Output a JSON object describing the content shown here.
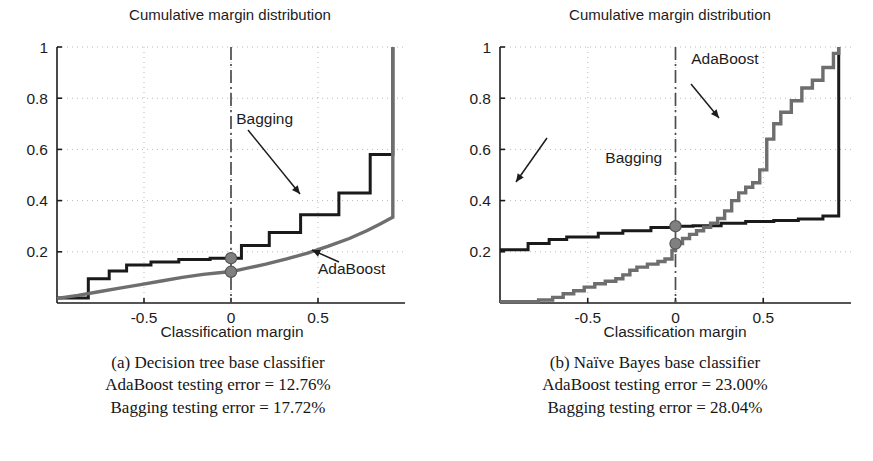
{
  "figure": {
    "background_color": "#ffffff",
    "panels": [
      {
        "id": "a",
        "title": "Cumulative margin distribution",
        "xlabel": "Classification margin",
        "ylabel": "",
        "caption_lines": [
          "(a) Decision tree base classifier",
          "AdaBoost testing error = 12.76%",
          "Bagging testing error = 17.72%"
        ],
        "annotations": [
          {
            "label": "Bagging",
            "x": 0.03,
            "y": 0.7
          },
          {
            "label": "AdaBoost",
            "x": 0.5,
            "y": 0.115
          }
        ]
      },
      {
        "id": "b",
        "title": "Cumulative margin distribution",
        "xlabel": "Classification margin",
        "ylabel": "",
        "caption_lines": [
          "(b) Naïve Bayes base classifier",
          "AdaBoost testing error = 23.00%",
          "Bagging testing error = 28.04%"
        ],
        "annotations": [
          {
            "label": "AdaBoost",
            "x": 0.09,
            "y": 0.935
          },
          {
            "label": "Bagging",
            "x": -0.4,
            "y": 0.545
          }
        ]
      }
    ]
  },
  "chart_data": [
    {
      "type": "line",
      "panel": "a",
      "title": "Cumulative margin distribution",
      "xlabel": "Classification margin",
      "ylabel": "",
      "xlim": [
        -1.0,
        1.0
      ],
      "ylim": [
        0.0,
        1.0
      ],
      "xticks": [
        -0.5,
        0,
        0.5
      ],
      "xtick_labels": [
        "-0.5",
        "0",
        "0.5"
      ],
      "yticks": [
        0.2,
        0.4,
        0.6,
        0.8,
        1
      ],
      "ytick_labels": [
        "0.2",
        "0.4",
        "0.6",
        "0.8",
        "1"
      ],
      "grid": "dotted",
      "legend_position": "inline-annotations",
      "reference_line": {
        "x": 0,
        "style": "dash-dot",
        "color": "#4d4d4d"
      },
      "series": [
        {
          "name": "Bagging",
          "style": "step",
          "color": "#1a1a1a",
          "width": 3.0,
          "x": [
            -1.0,
            -0.82,
            -0.82,
            -0.7,
            -0.7,
            -0.6,
            -0.6,
            -0.46,
            -0.46,
            -0.3,
            -0.3,
            -0.12,
            -0.12,
            0.0,
            0.0,
            0.06,
            0.06,
            0.22,
            0.22,
            0.4,
            0.4,
            0.62,
            0.62,
            0.8,
            0.8,
            0.93,
            0.93
          ],
          "y": [
            0.02,
            0.02,
            0.095,
            0.095,
            0.125,
            0.125,
            0.148,
            0.148,
            0.16,
            0.16,
            0.17,
            0.17,
            0.175,
            0.175,
            0.175,
            0.175,
            0.225,
            0.225,
            0.275,
            0.275,
            0.345,
            0.345,
            0.43,
            0.43,
            0.58,
            0.58,
            1.0
          ]
        },
        {
          "name": "AdaBoost",
          "style": "smooth",
          "color": "#6e6e6e",
          "width": 3.4,
          "x": [
            -1.0,
            -0.88,
            -0.76,
            -0.64,
            -0.52,
            -0.4,
            -0.28,
            -0.16,
            -0.04,
            0.0,
            0.08,
            0.2,
            0.32,
            0.44,
            0.56,
            0.68,
            0.78,
            0.86,
            0.91,
            0.93,
            0.93
          ],
          "y": [
            0.018,
            0.03,
            0.044,
            0.058,
            0.072,
            0.086,
            0.1,
            0.112,
            0.12,
            0.122,
            0.134,
            0.152,
            0.172,
            0.195,
            0.222,
            0.252,
            0.282,
            0.31,
            0.328,
            0.335,
            1.0
          ]
        }
      ],
      "markers": [
        {
          "series": "Bagging",
          "x": 0,
          "y": 0.175,
          "color": "#808080",
          "shape": "circle"
        },
        {
          "series": "AdaBoost",
          "x": 0,
          "y": 0.122,
          "color": "#808080",
          "shape": "circle"
        }
      ]
    },
    {
      "type": "line",
      "panel": "b",
      "title": "Cumulative margin distribution",
      "xlabel": "Classification margin",
      "ylabel": "",
      "xlim": [
        -1.0,
        1.0
      ],
      "ylim": [
        0.0,
        1.0
      ],
      "xticks": [
        -0.5,
        0,
        0.5
      ],
      "xtick_labels": [
        "-0.5",
        "0",
        "0.5"
      ],
      "yticks": [
        0.2,
        0.4,
        0.6,
        0.8,
        1
      ],
      "ytick_labels": [
        "0.2",
        "0.4",
        "0.6",
        "0.8",
        "1"
      ],
      "grid": "dotted",
      "legend_position": "inline-annotations",
      "reference_line": {
        "x": 0,
        "style": "dash-dot",
        "color": "#4d4d4d"
      },
      "series": [
        {
          "name": "Bagging",
          "style": "step",
          "color": "#1a1a1a",
          "width": 3.0,
          "x": [
            -1.0,
            -0.84,
            -0.84,
            -0.72,
            -0.72,
            -0.62,
            -0.62,
            -0.44,
            -0.44,
            -0.3,
            -0.3,
            -0.14,
            -0.14,
            0.0,
            0.0,
            0.1,
            0.1,
            0.26,
            0.26,
            0.4,
            0.4,
            0.56,
            0.56,
            0.7,
            0.7,
            0.84,
            0.84,
            0.93,
            0.93
          ],
          "y": [
            0.208,
            0.208,
            0.232,
            0.232,
            0.248,
            0.248,
            0.258,
            0.258,
            0.272,
            0.272,
            0.282,
            0.282,
            0.295,
            0.295,
            0.3,
            0.3,
            0.302,
            0.302,
            0.312,
            0.312,
            0.318,
            0.318,
            0.322,
            0.322,
            0.328,
            0.328,
            0.34,
            0.34,
            1.0
          ]
        },
        {
          "name": "AdaBoost",
          "style": "step",
          "color": "#6e6e6e",
          "width": 3.4,
          "x": [
            -1.0,
            -0.78,
            -0.78,
            -0.7,
            -0.7,
            -0.64,
            -0.64,
            -0.58,
            -0.58,
            -0.52,
            -0.52,
            -0.46,
            -0.46,
            -0.4,
            -0.4,
            -0.34,
            -0.34,
            -0.3,
            -0.3,
            -0.26,
            -0.26,
            -0.22,
            -0.22,
            -0.16,
            -0.16,
            -0.1,
            -0.1,
            -0.06,
            -0.06,
            -0.02,
            -0.02,
            0.0,
            0.0,
            0.04,
            0.04,
            0.08,
            0.08,
            0.12,
            0.12,
            0.16,
            0.16,
            0.2,
            0.2,
            0.24,
            0.24,
            0.28,
            0.28,
            0.32,
            0.32,
            0.36,
            0.36,
            0.4,
            0.4,
            0.44,
            0.44,
            0.48,
            0.48,
            0.52,
            0.52,
            0.56,
            0.56,
            0.6,
            0.6,
            0.66,
            0.66,
            0.72,
            0.72,
            0.78,
            0.78,
            0.84,
            0.84,
            0.9,
            0.9,
            0.93,
            0.93
          ],
          "y": [
            0.005,
            0.005,
            0.012,
            0.012,
            0.022,
            0.022,
            0.036,
            0.036,
            0.048,
            0.048,
            0.062,
            0.062,
            0.075,
            0.075,
            0.085,
            0.085,
            0.095,
            0.095,
            0.11,
            0.11,
            0.128,
            0.128,
            0.14,
            0.14,
            0.152,
            0.152,
            0.162,
            0.162,
            0.172,
            0.172,
            0.205,
            0.205,
            0.232,
            0.232,
            0.252,
            0.252,
            0.268,
            0.268,
            0.282,
            0.282,
            0.296,
            0.296,
            0.312,
            0.312,
            0.33,
            0.33,
            0.36,
            0.36,
            0.4,
            0.4,
            0.43,
            0.43,
            0.452,
            0.452,
            0.47,
            0.47,
            0.52,
            0.52,
            0.64,
            0.64,
            0.7,
            0.7,
            0.745,
            0.745,
            0.79,
            0.79,
            0.84,
            0.84,
            0.87,
            0.87,
            0.92,
            0.92,
            0.975,
            0.975,
            1.0
          ]
        }
      ],
      "markers": [
        {
          "series": "Bagging",
          "x": 0,
          "y": 0.3,
          "color": "#808080",
          "shape": "circle"
        },
        {
          "series": "AdaBoost",
          "x": 0,
          "y": 0.232,
          "color": "#808080",
          "shape": "circle"
        }
      ]
    }
  ]
}
